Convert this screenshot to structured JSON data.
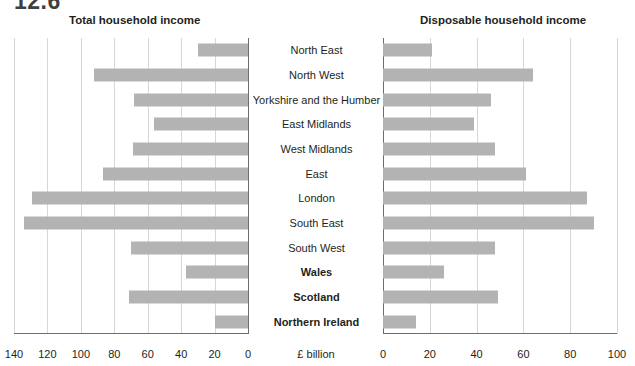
{
  "clipped_heading": "12.6",
  "axis_unit_label": "£ billion",
  "titles": {
    "left": "Total household income",
    "right": "Disposable household income"
  },
  "colors": {
    "bar": "#b3b3b3",
    "grid": "#d7d7d7",
    "axis": "#6d6d6d",
    "text": "#231f20"
  },
  "left_ticks": [
    "140",
    "120",
    "100",
    "80",
    "60",
    "40",
    "20",
    "0"
  ],
  "right_ticks": [
    "0",
    "20",
    "40",
    "60",
    "80",
    "100"
  ],
  "chart_data": {
    "type": "bar",
    "xlabel": "£ billion",
    "ylabel": "",
    "orientation": "horizontal",
    "grid": true,
    "legend": "none",
    "categories": [
      "North East",
      "North West",
      "Yorkshire and the Humber",
      "East Midlands",
      "West Midlands",
      "East",
      "London",
      "South East",
      "South West",
      "Wales",
      "Scotland",
      "Northern Ireland"
    ],
    "bold_categories": [
      "Wales",
      "Scotland",
      "Northern Ireland"
    ],
    "panels": [
      {
        "name": "Total household income",
        "axis_direction": "reversed",
        "xlim": [
          140,
          0
        ],
        "ticks": [
          140,
          120,
          100,
          80,
          60,
          40,
          20,
          0
        ],
        "values": [
          30,
          92,
          68,
          56,
          69,
          87,
          129,
          134,
          70,
          37,
          71,
          20
        ]
      },
      {
        "name": "Disposable household income",
        "axis_direction": "normal",
        "xlim": [
          0,
          100
        ],
        "ticks": [
          0,
          20,
          40,
          60,
          80,
          100
        ],
        "values": [
          21,
          64,
          46,
          39,
          48,
          61,
          87,
          90,
          48,
          26,
          49,
          14
        ]
      }
    ],
    "series": [
      {
        "name": "Total household income",
        "values": [
          30,
          92,
          68,
          56,
          69,
          87,
          129,
          134,
          70,
          37,
          71,
          20
        ]
      },
      {
        "name": "Disposable household income",
        "values": [
          21,
          64,
          46,
          39,
          48,
          61,
          87,
          90,
          48,
          26,
          49,
          14
        ]
      }
    ]
  }
}
